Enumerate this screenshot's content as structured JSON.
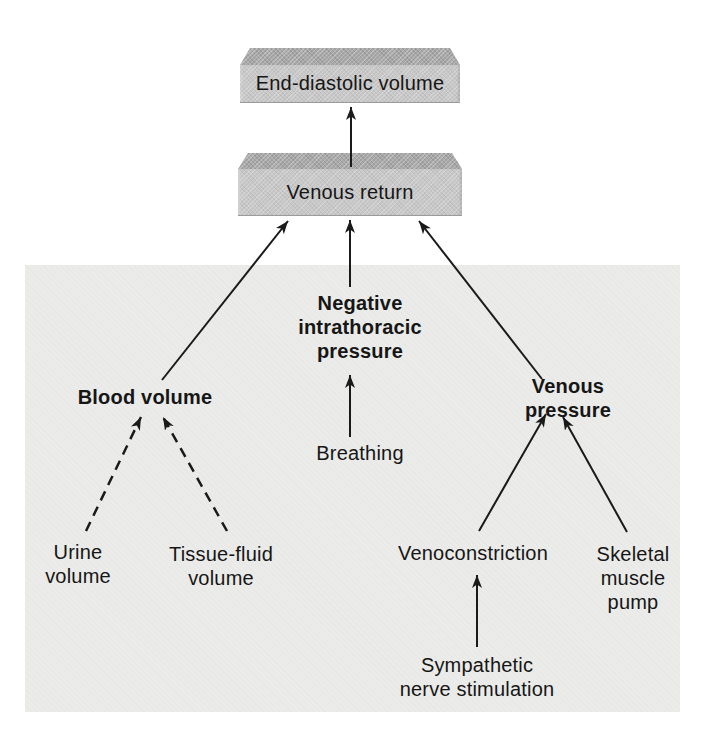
{
  "diagram": {
    "colors": {
      "background": "#ffffff",
      "panel": "#ebebe9",
      "box_front": "#c8c8c8",
      "box_top": "#a9a9a9",
      "line": "#1a1a1a",
      "text": "#161616"
    },
    "nodes": {
      "end_diastolic_volume": {
        "label": "End-diastolic volume",
        "shape": "3d-box",
        "emphasis": "regular"
      },
      "venous_return": {
        "label": "Venous return",
        "shape": "3d-box",
        "emphasis": "regular"
      },
      "negative_intrathoracic_pressure": {
        "label": "Negative\nintrathoracic\npressure",
        "shape": "text",
        "emphasis": "bold"
      },
      "blood_volume": {
        "label": "Blood volume",
        "shape": "text",
        "emphasis": "bold"
      },
      "venous_pressure": {
        "label": "Venous pressure",
        "shape": "text",
        "emphasis": "bold"
      },
      "breathing": {
        "label": "Breathing",
        "shape": "text",
        "emphasis": "regular"
      },
      "urine_volume": {
        "label": "Urine\nvolume",
        "shape": "text",
        "emphasis": "regular"
      },
      "tissue_fluid_volume": {
        "label": "Tissue-fluid\nvolume",
        "shape": "text",
        "emphasis": "regular"
      },
      "venoconstriction": {
        "label": "Venoconstriction",
        "shape": "text",
        "emphasis": "regular"
      },
      "skeletal_muscle_pump": {
        "label": "Skeletal\nmuscle\npump",
        "shape": "text",
        "emphasis": "regular"
      },
      "sympathetic_nerve_stimulation": {
        "label": "Sympathetic\nnerve stimulation",
        "shape": "text",
        "emphasis": "regular"
      }
    },
    "edges": [
      {
        "from": "venous_return",
        "to": "end_diastolic_volume",
        "style": "solid"
      },
      {
        "from": "blood_volume",
        "to": "venous_return",
        "style": "solid"
      },
      {
        "from": "negative_intrathoracic_pressure",
        "to": "venous_return",
        "style": "solid"
      },
      {
        "from": "venous_pressure",
        "to": "venous_return",
        "style": "solid"
      },
      {
        "from": "breathing",
        "to": "negative_intrathoracic_pressure",
        "style": "solid"
      },
      {
        "from": "urine_volume",
        "to": "blood_volume",
        "style": "dashed"
      },
      {
        "from": "tissue_fluid_volume",
        "to": "blood_volume",
        "style": "dashed"
      },
      {
        "from": "venoconstriction",
        "to": "venous_pressure",
        "style": "solid"
      },
      {
        "from": "skeletal_muscle_pump",
        "to": "venous_pressure",
        "style": "solid"
      },
      {
        "from": "sympathetic_nerve_stimulation",
        "to": "venoconstriction",
        "style": "solid"
      }
    ]
  }
}
